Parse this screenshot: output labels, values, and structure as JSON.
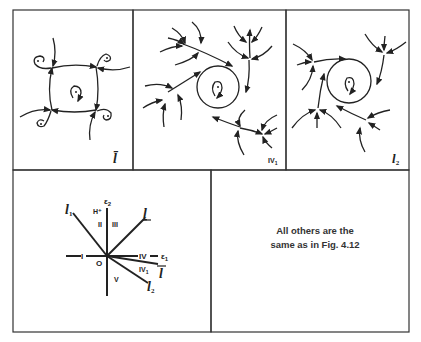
{
  "panels": {
    "top_left": {
      "label": "l̄"
    },
    "top_middle": {
      "label_main": "IV",
      "label_sub": "1"
    },
    "top_right": {
      "label_main": "l",
      "label_sub": "2"
    }
  },
  "bifurcation_diagram": {
    "axis_y_label_main": "ε",
    "axis_y_label_sub": "2",
    "axis_x_label_main": "ε",
    "axis_x_label_sub": "1",
    "origin_label": "O",
    "regions": {
      "H_plus": "H⁺",
      "I": "I",
      "II": "II",
      "III": "III",
      "IV": "IV",
      "IV1_main": "IV",
      "IV1_sub": "1",
      "V": "V"
    },
    "curves": {
      "l1_main": "l",
      "l1_sub": "1",
      "l": "l",
      "lbar": "l",
      "l2_main": "l",
      "l2_sub": "2"
    }
  },
  "note": {
    "line1": "All others are the",
    "line2": "same as in Fig. 4.12"
  }
}
